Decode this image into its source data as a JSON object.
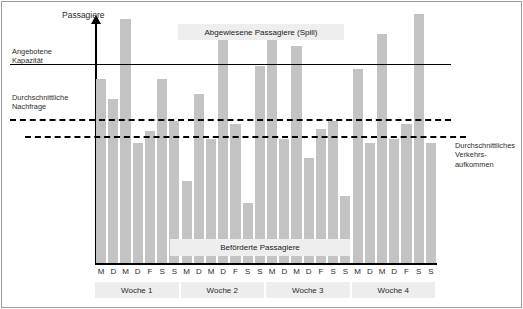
{
  "figure": {
    "y_axis_title": "Passagiere",
    "labels": {
      "capacity": "Angebotene\nKapazität",
      "demand": "Durchschnittliche\nNachfrage",
      "traffic": "Durchschnittliches\nVerkehrs-\naufkommen"
    },
    "callouts": {
      "spill": "Abgewiesene Passagiere (Spill)",
      "carried": "Beförderte Passagiere"
    },
    "colors": {
      "bar": "#c3c3c3",
      "axis": "#000000",
      "callout_bg": "#eeeeee",
      "week_band_bg": "#ededed",
      "frame": "#9b9b9b"
    }
  },
  "chart_data": {
    "type": "bar",
    "title": "",
    "xlabel": "",
    "ylabel": "Passagiere",
    "grid": false,
    "legend_position": "inline-callouts",
    "ylim": [
      0,
      100
    ],
    "categories": [
      "M",
      "D",
      "M",
      "D",
      "F",
      "S",
      "S",
      "M",
      "D",
      "M",
      "D",
      "F",
      "S",
      "S",
      "M",
      "D",
      "M",
      "D",
      "F",
      "S",
      "S",
      "M",
      "D",
      "M",
      "D",
      "F",
      "S",
      "S"
    ],
    "groups": [
      {
        "label": "Woche 1",
        "start": 0,
        "count": 7
      },
      {
        "label": "Woche 2",
        "start": 7,
        "count": 7
      },
      {
        "label": "Woche 3",
        "start": 14,
        "count": 7
      },
      {
        "label": "Woche 4",
        "start": 21,
        "count": 7
      }
    ],
    "values": [
      74,
      66,
      98,
      48,
      53,
      74,
      57,
      33,
      68,
      50,
      95,
      56,
      24,
      79,
      96,
      50,
      87,
      42,
      54,
      57,
      27,
      78,
      48,
      92,
      50,
      56,
      100,
      48
    ],
    "reference_lines": [
      {
        "name": "Angebotene Kapazität",
        "value": 84,
        "style": "solid"
      },
      {
        "name": "Durchschnittliche Nachfrage",
        "value": 59,
        "style": "dashed"
      },
      {
        "name": "Durchschnittliches Verkehrsaufkommen",
        "value": 51,
        "style": "dashed"
      }
    ]
  }
}
